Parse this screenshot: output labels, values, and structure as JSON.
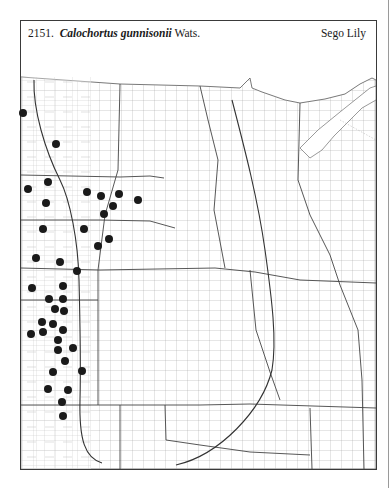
{
  "header": {
    "number": "2151.",
    "genus_species": "Calochortus gunnisonii",
    "authority": "Wats.",
    "common_name": "Sego Lily"
  },
  "map": {
    "region": "Great Plains county distribution map",
    "dot_color": "#1a1a1a",
    "line_color": "#444444",
    "dot_radius": 4,
    "occurrences": [
      [
        23,
        113
      ],
      [
        56,
        144
      ],
      [
        48,
        182
      ],
      [
        28,
        189
      ],
      [
        46,
        203
      ],
      [
        87,
        192
      ],
      [
        101,
        196
      ],
      [
        119,
        194
      ],
      [
        138,
        200
      ],
      [
        113,
        206
      ],
      [
        104,
        214
      ],
      [
        43,
        229
      ],
      [
        84,
        229
      ],
      [
        109,
        239
      ],
      [
        98,
        246
      ],
      [
        36,
        258
      ],
      [
        60,
        262
      ],
      [
        77,
        271
      ],
      [
        32,
        288
      ],
      [
        63,
        286
      ],
      [
        49,
        299
      ],
      [
        63,
        299
      ],
      [
        55,
        309
      ],
      [
        64,
        311
      ],
      [
        42,
        322
      ],
      [
        53,
        324
      ],
      [
        63,
        330
      ],
      [
        31,
        334
      ],
      [
        43,
        332
      ],
      [
        58,
        340
      ],
      [
        73,
        348
      ],
      [
        58,
        350
      ],
      [
        65,
        361
      ],
      [
        82,
        371
      ],
      [
        53,
        372
      ],
      [
        48,
        389
      ],
      [
        68,
        390
      ],
      [
        62,
        402
      ],
      [
        63,
        416
      ]
    ]
  }
}
